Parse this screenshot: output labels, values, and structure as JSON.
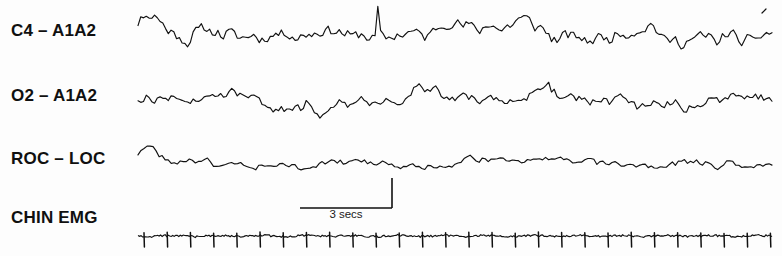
{
  "recording": {
    "type": "polysomnogram",
    "background_color": "#fdfdfd",
    "trace_color": "#111111"
  },
  "channels": [
    {
      "id": "c4",
      "label": "C4 – A1A2",
      "baseline_y": 33,
      "amplitude": 24,
      "name": "channel-c4-a1a2"
    },
    {
      "id": "o2",
      "label": "O2 – A1A2",
      "baseline_y": 99,
      "amplitude": 21,
      "name": "channel-o2-a1a2"
    },
    {
      "id": "roc",
      "label": "ROC – LOC",
      "baseline_y": 163,
      "amplitude": 14,
      "name": "channel-roc-loc"
    },
    {
      "id": "chin",
      "label": "CHIN EMG",
      "baseline_y": 236,
      "amplitude": 3,
      "name": "channel-chin-emg"
    }
  ],
  "calibration": {
    "label": "3 secs",
    "duration_seconds": 3,
    "x_start": 300,
    "x_end": 392,
    "bracket_y": 208,
    "tick_top_y": 178
  },
  "chart_data": {
    "type": "line",
    "title": "",
    "xlabel": "",
    "ylabel": "",
    "grid": false,
    "legend": "none",
    "x_axis_units": "seconds",
    "x_range_seconds": [
      0,
      20.3
    ],
    "scale_bar_seconds": 3,
    "trace_x_start": 138,
    "trace_x_end": 772,
    "series": [
      {
        "name": "C4 – A1A2",
        "description": "EEG central derivation, mixed-frequency moderate-to-high amplitude activity with one tall narrow vertex-like transient near mid-epoch",
        "baseline_y": 33,
        "amplitude_px": 24,
        "seed": 11,
        "segments": 230,
        "spikes": [
          {
            "x": 378,
            "height": 30
          }
        ]
      },
      {
        "name": "O2 – A1A2",
        "description": "EEG occipital derivation, mixed-frequency activity similar to C4 with slightly lower amplitude",
        "baseline_y": 99,
        "amplitude_px": 21,
        "seed": 27,
        "segments": 230,
        "spikes": []
      },
      {
        "name": "ROC – LOC",
        "description": "Electro-oculogram, lower amplitude irregular activity with occasional slow eye-movement deflections",
        "baseline_y": 163,
        "amplitude_px": 14,
        "seed": 43,
        "segments": 210,
        "spikes": []
      },
      {
        "name": "CHIN EMG",
        "description": "Submental electromyogram, low tonic baseline with regular downward ECG artifact spikes",
        "baseline_y": 236,
        "amplitude_px": 3,
        "seed": 59,
        "spike_interval_px": 23.2,
        "spike_height_px": 11,
        "spike_count": 28
      }
    ]
  }
}
